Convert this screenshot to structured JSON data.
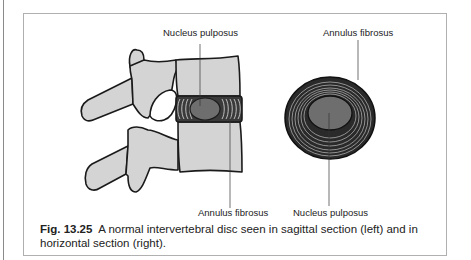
{
  "figure": {
    "labels": {
      "sagittal_top": "Nucleus pulposus",
      "sagittal_bottom": "Annulus fibrosus",
      "horizontal_top": "Annulus fibrosus",
      "horizontal_bottom": "Nucleus pulposus"
    },
    "caption": {
      "number": "Fig. 13.25",
      "text": "A normal intervertebral disc seen in sagittal section (left) and in horizontal section (right)."
    },
    "colors": {
      "bone_fill": "#d4d4d4",
      "nucleus_fill": "#6e6e6e",
      "annulus_ring": "#2a2a2a",
      "outline": "#1a1a1a"
    }
  }
}
